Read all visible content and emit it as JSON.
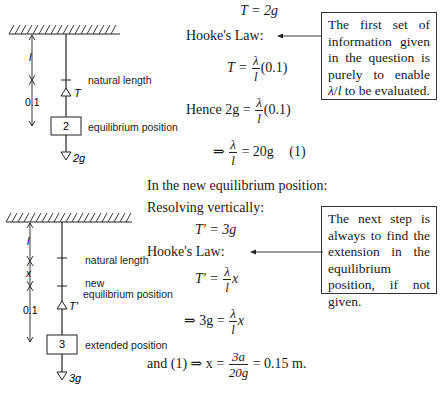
{
  "diagram1": {
    "length_label": "l",
    "extension_label": "0.1",
    "tension_label": "T",
    "mass_label": "2",
    "weight_label": "2g",
    "natural_length_label": "natural length",
    "equilibrium_label": "equilibrium position"
  },
  "diagram2": {
    "length_label": "l",
    "x_label": "x",
    "extension_label": "0.1",
    "tension_label": "T'",
    "mass_label": "3",
    "weight_label": "3g",
    "natural_length_label": "natural length",
    "new_eq_label_1": "new",
    "new_eq_label_2": "equilibrium position",
    "extended_label": "extended position"
  },
  "working1": {
    "eq_T": "T = 2g",
    "hookes_heading": "Hooke's Law:",
    "eq_hooke_lhs": "T =",
    "eq_hooke_num": "λ",
    "eq_hooke_den": "l",
    "eq_hooke_rhs": "(0.1)",
    "hence_lhs": "Hence 2g =",
    "hence_num": "λ",
    "hence_den": "l",
    "hence_rhs": "(0.1)",
    "result_arrow": "⇒",
    "result_num": "λ",
    "result_den": "l",
    "result_rhs": "= 20g",
    "result_tag": "(1)"
  },
  "transition": "In the new equilibrium position:",
  "working2": {
    "resolving_heading": "Resolving vertically:",
    "eq_T": "T' = 3g",
    "hookes_heading": "Hooke's Law:",
    "eq_hooke_lhs": "T' =",
    "eq_hooke_num": "λ",
    "eq_hooke_den": "l",
    "eq_hooke_rhs": "x",
    "step_lhs": "⇒ 3g =",
    "step_num": "λ",
    "step_den": "l",
    "step_rhs": "x",
    "final_lhs": "and (1) ⇒ x =",
    "final_num": "3a",
    "final_den": "20g",
    "final_rhs": "= 0.15 m."
  },
  "notes": [
    {
      "text_html": "The first set of information given in the question is purely to enable <i>λ</i>/<i>l</i> to be evaluated."
    },
    {
      "text_html": "The next step is always to find the extension in the equilibrium position, if not given."
    }
  ]
}
